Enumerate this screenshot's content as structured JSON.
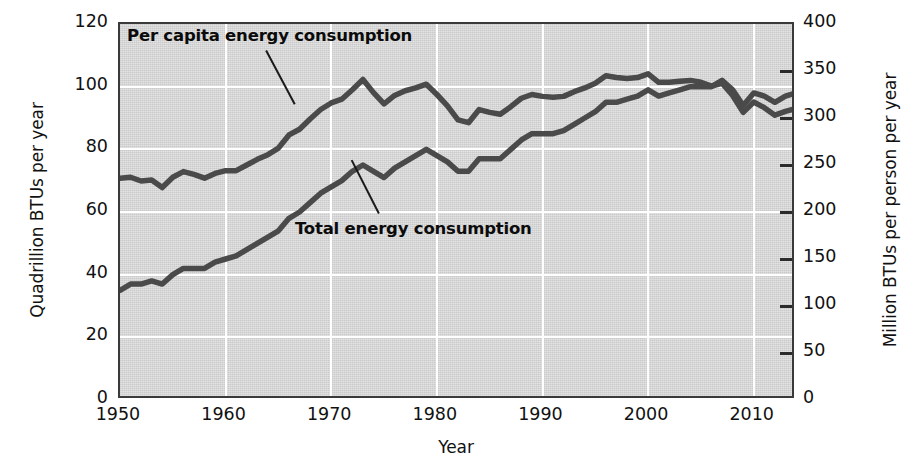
{
  "chart_data": {
    "type": "line",
    "title": "",
    "xlabel": "Year",
    "ylabel": "Quadrillion BTUs per year",
    "ylabel_right": "Million BTUs per person per year",
    "xlim": [
      1950,
      2014
    ],
    "ylim": [
      0,
      120
    ],
    "ylim_right": [
      0,
      400
    ],
    "grid": true,
    "legend_position": "inline-annotations",
    "xticks": [
      "1950",
      "1960",
      "1970",
      "1980",
      "1990",
      "2000",
      "2010"
    ],
    "xtick_values": [
      1950,
      1960,
      1970,
      1980,
      1990,
      2000,
      2010
    ],
    "yticks_left": [
      "0",
      "20",
      "40",
      "60",
      "80",
      "100",
      "120"
    ],
    "ytick_values_left": [
      0,
      20,
      40,
      60,
      80,
      100,
      120
    ],
    "yticks_right": [
      "0",
      "50",
      "100",
      "150",
      "200",
      "250",
      "300",
      "350",
      "400"
    ],
    "ytick_values_right": [
      0,
      50,
      100,
      150,
      200,
      250,
      300,
      350,
      400
    ],
    "annotations": [
      {
        "text": "Per capita energy consumption",
        "series": "per_capita_energy_consumption"
      },
      {
        "text": "Total energy consumption",
        "series": "total_energy_consumption"
      }
    ],
    "x": [
      1950,
      1951,
      1952,
      1953,
      1954,
      1955,
      1956,
      1957,
      1958,
      1959,
      1960,
      1961,
      1962,
      1963,
      1964,
      1965,
      1966,
      1967,
      1968,
      1969,
      1970,
      1971,
      1972,
      1973,
      1974,
      1975,
      1976,
      1977,
      1978,
      1979,
      1980,
      1981,
      1982,
      1983,
      1984,
      1985,
      1986,
      1987,
      1988,
      1989,
      1990,
      1991,
      1992,
      1993,
      1994,
      1995,
      1996,
      1997,
      1998,
      1999,
      2000,
      2001,
      2002,
      2003,
      2004,
      2005,
      2006,
      2007,
      2008,
      2009,
      2010,
      2011,
      2012,
      2013,
      2014
    ],
    "series": [
      {
        "name": "Total energy consumption",
        "axis": "left",
        "units": "Quadrillion BTUs per year",
        "color": "#4a4a4a",
        "values": [
          35,
          37,
          37,
          38,
          37,
          40,
          42,
          42,
          42,
          44,
          45,
          46,
          48,
          50,
          52,
          54,
          58,
          60,
          63,
          66,
          68,
          70,
          73,
          75,
          73,
          71,
          74,
          76,
          78,
          80,
          78,
          76,
          73,
          73,
          77,
          77,
          77,
          80,
          83,
          85,
          85,
          85,
          86,
          88,
          90,
          92,
          95,
          95,
          96,
          97,
          99,
          97,
          98,
          99,
          100,
          100,
          100,
          102,
          99,
          94,
          98,
          97,
          95,
          97,
          98
        ]
      },
      {
        "name": "Per capita energy consumption",
        "axis": "right",
        "units": "Million BTUs per person per year",
        "color": "#4a4a4a",
        "values": [
          236,
          237,
          233,
          234,
          226,
          237,
          243,
          240,
          236,
          241,
          244,
          244,
          250,
          256,
          261,
          268,
          282,
          288,
          299,
          309,
          316,
          320,
          330,
          341,
          327,
          315,
          324,
          329,
          332,
          336,
          325,
          313,
          298,
          295,
          309,
          306,
          304,
          312,
          321,
          325,
          323,
          322,
          323,
          328,
          332,
          337,
          345,
          343,
          342,
          343,
          347,
          338,
          338,
          339,
          340,
          338,
          334,
          337,
          324,
          306,
          317,
          311,
          303,
          307,
          310
        ]
      }
    ]
  },
  "axes": {
    "left_title": "Quadrillion BTUs per year",
    "right_title": "Million BTUs per person per year",
    "bottom_title": "Year"
  },
  "colors": {
    "plot_background": "#d6d6d6",
    "gridline": "#ffffff",
    "series_stroke": "#4a4a4a",
    "frame": "#3a3a3a",
    "text": "#111111"
  }
}
